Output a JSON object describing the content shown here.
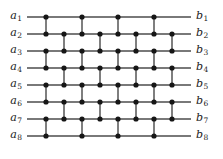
{
  "figure": {
    "type": "comparator-network-diagram",
    "background": "#ffffff",
    "wire_color": "#4d4d4d",
    "node_color": "#161616",
    "width": 223,
    "height": 159
  },
  "inputs": [
    {
      "base": "a",
      "index": "1"
    },
    {
      "base": "a",
      "index": "2"
    },
    {
      "base": "a",
      "index": "3"
    },
    {
      "base": "a",
      "index": "4"
    },
    {
      "base": "a",
      "index": "5"
    },
    {
      "base": "a",
      "index": "6"
    },
    {
      "base": "a",
      "index": "7"
    },
    {
      "base": "a",
      "index": "8"
    }
  ],
  "outputs": [
    {
      "base": "b",
      "index": "1"
    },
    {
      "base": "b",
      "index": "2"
    },
    {
      "base": "b",
      "index": "3"
    },
    {
      "base": "b",
      "index": "4"
    },
    {
      "base": "b",
      "index": "5"
    },
    {
      "base": "b",
      "index": "6"
    },
    {
      "base": "b",
      "index": "7"
    },
    {
      "base": "b",
      "index": "8"
    }
  ],
  "geometry": {
    "row_y": [
      17,
      34,
      51,
      68,
      85,
      102,
      119,
      136
    ],
    "col_x": [
      46,
      64,
      82,
      100,
      118,
      136,
      154,
      172
    ],
    "wire_x_start": 27,
    "wire_x_end": 191,
    "label_left_x": 4,
    "label_right_x": 196,
    "node_radius": 2.6
  },
  "comparators": [
    {
      "column": 1,
      "x": 46,
      "top_row": 1,
      "bottom_row": 2
    },
    {
      "column": 1,
      "x": 46,
      "top_row": 3,
      "bottom_row": 4
    },
    {
      "column": 1,
      "x": 46,
      "top_row": 5,
      "bottom_row": 6
    },
    {
      "column": 1,
      "x": 46,
      "top_row": 7,
      "bottom_row": 8
    },
    {
      "column": 2,
      "x": 64,
      "top_row": 2,
      "bottom_row": 3
    },
    {
      "column": 2,
      "x": 64,
      "top_row": 4,
      "bottom_row": 5
    },
    {
      "column": 2,
      "x": 64,
      "top_row": 6,
      "bottom_row": 7
    },
    {
      "column": 3,
      "x": 82,
      "top_row": 1,
      "bottom_row": 2
    },
    {
      "column": 3,
      "x": 82,
      "top_row": 3,
      "bottom_row": 4
    },
    {
      "column": 3,
      "x": 82,
      "top_row": 5,
      "bottom_row": 6
    },
    {
      "column": 3,
      "x": 82,
      "top_row": 7,
      "bottom_row": 8
    },
    {
      "column": 4,
      "x": 100,
      "top_row": 2,
      "bottom_row": 3
    },
    {
      "column": 4,
      "x": 100,
      "top_row": 4,
      "bottom_row": 5
    },
    {
      "column": 4,
      "x": 100,
      "top_row": 6,
      "bottom_row": 7
    },
    {
      "column": 5,
      "x": 118,
      "top_row": 1,
      "bottom_row": 2
    },
    {
      "column": 5,
      "x": 118,
      "top_row": 3,
      "bottom_row": 4
    },
    {
      "column": 5,
      "x": 118,
      "top_row": 5,
      "bottom_row": 6
    },
    {
      "column": 5,
      "x": 118,
      "top_row": 7,
      "bottom_row": 8
    },
    {
      "column": 6,
      "x": 136,
      "top_row": 2,
      "bottom_row": 3
    },
    {
      "column": 6,
      "x": 136,
      "top_row": 4,
      "bottom_row": 5
    },
    {
      "column": 6,
      "x": 136,
      "top_row": 6,
      "bottom_row": 7
    },
    {
      "column": 7,
      "x": 154,
      "top_row": 1,
      "bottom_row": 2
    },
    {
      "column": 7,
      "x": 154,
      "top_row": 3,
      "bottom_row": 4
    },
    {
      "column": 7,
      "x": 154,
      "top_row": 5,
      "bottom_row": 6
    },
    {
      "column": 7,
      "x": 154,
      "top_row": 7,
      "bottom_row": 8
    },
    {
      "column": 8,
      "x": 172,
      "top_row": 2,
      "bottom_row": 3
    },
    {
      "column": 8,
      "x": 172,
      "top_row": 4,
      "bottom_row": 5
    },
    {
      "column": 8,
      "x": 172,
      "top_row": 6,
      "bottom_row": 7
    }
  ]
}
